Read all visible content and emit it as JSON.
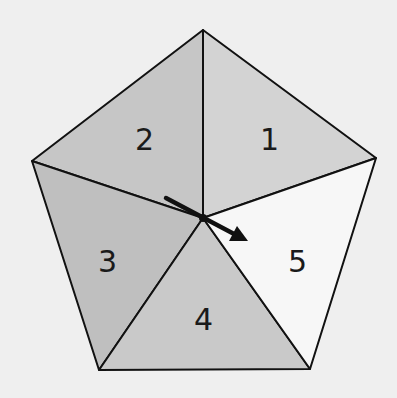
{
  "diagram": {
    "colors": {
      "background": "#efefef",
      "stroke": "#111111",
      "region_1": "#d3d3d3",
      "region_2": "#c6c6c6",
      "region_3": "#bfbfbf",
      "region_4": "#c9c9c9",
      "region_5": "#f7f7f7"
    },
    "regions": [
      {
        "id": "1",
        "label": "1"
      },
      {
        "id": "2",
        "label": "2"
      },
      {
        "id": "3",
        "label": "3"
      },
      {
        "id": "4",
        "label": "4"
      },
      {
        "id": "5",
        "label": "5"
      }
    ],
    "arrow": {
      "direction": "down-right",
      "description": "arrow through center pointing into region 5"
    }
  }
}
